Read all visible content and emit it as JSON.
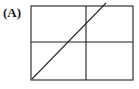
{
  "figure": {
    "panel_label": "(A)",
    "background_color": "#ffffff",
    "line_color": "#2b2b2b",
    "frame_color": "#1f1f1f"
  },
  "chart_data": {
    "type": "line",
    "title": "(A)",
    "xlabel": "",
    "ylabel": "",
    "xlim": [
      0,
      1
    ],
    "ylim": [
      0,
      1
    ],
    "grid": false,
    "legend": null,
    "frame": {
      "x_left_px": 31,
      "x_right_px": 133,
      "y_top_px": 6,
      "y_bottom_px": 80,
      "border": true
    },
    "annotations": [
      {
        "name": "horizontal-axis-line",
        "type": "hline",
        "y": 0.5,
        "y_px": 42,
        "x_start": 0,
        "x_end": 1
      },
      {
        "name": "vertical-axis-line",
        "type": "vline",
        "x": 0.54,
        "x_px": 86,
        "y_start": 0,
        "y_end": 1
      }
    ],
    "series": [
      {
        "name": "diagonal",
        "x": [
          0,
          0.73
        ],
        "y": [
          0,
          1.05
        ],
        "x_px": [
          32,
          106
        ],
        "y_px": [
          79,
          3
        ],
        "style": "solid",
        "color": "#2b2b2b"
      }
    ]
  }
}
